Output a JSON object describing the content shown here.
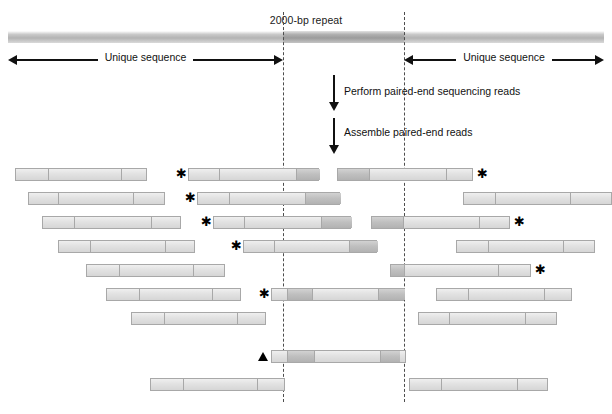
{
  "figure": {
    "width": 612,
    "height": 414,
    "background": "#ffffff"
  },
  "genome": {
    "repeat_label": "2000-bp repeat",
    "left_unique_label": "Unique sequence",
    "right_unique_label": "Unique sequence",
    "repeat_start_x": 283,
    "repeat_end_x": 404,
    "band_color": "#b3b3b3",
    "repeat_color": "#9b9b9b"
  },
  "steps": [
    {
      "label": "Perform paired-end sequencing reads"
    },
    {
      "label": "Assemble paired-end reads"
    }
  ],
  "markers": {
    "star_glyph": "✱",
    "triangle_name": "triangle-marker"
  },
  "chart_data": {
    "type": "diagram",
    "repeat_region": {
      "start_x": 283,
      "end_x": 404,
      "length_bp": 2000
    },
    "reads": [
      {
        "row": 1,
        "x": 15,
        "w": 132,
        "ticks": [
          32,
          105
        ],
        "dark": [],
        "star": null
      },
      {
        "row": 1,
        "x": 188,
        "w": 131,
        "ticks": [
          30,
          107
        ],
        "dark": [
          [
            107,
            24
          ]
        ],
        "star": "left"
      },
      {
        "row": 1,
        "x": 337,
        "w": 136,
        "ticks": [
          31,
          108
        ],
        "dark": [
          [
            0,
            31
          ]
        ],
        "star": "right"
      },
      {
        "row": 2,
        "x": 28,
        "w": 137,
        "ticks": [
          29,
          104
        ],
        "dark": [],
        "star": null
      },
      {
        "row": 2,
        "x": 197,
        "w": 143,
        "ticks": [
          31,
          107
        ],
        "dark": [
          [
            107,
            36
          ]
        ],
        "star": "left"
      },
      {
        "row": 2,
        "x": 463,
        "w": 149,
        "ticks": [
          31,
          106
        ],
        "dark": [],
        "star": null
      },
      {
        "row": 3,
        "x": 42,
        "w": 139,
        "ticks": [
          31,
          108
        ],
        "dark": [],
        "star": null
      },
      {
        "row": 3,
        "x": 213,
        "w": 138,
        "ticks": [
          30,
          107
        ],
        "dark": [
          [
            107,
            31
          ]
        ],
        "star": "left"
      },
      {
        "row": 3,
        "x": 371,
        "w": 139,
        "ticks": [
          31,
          107
        ],
        "dark": [
          [
            0,
            31
          ]
        ],
        "star": "right"
      },
      {
        "row": 4,
        "x": 58,
        "w": 137,
        "ticks": [
          31,
          106
        ],
        "dark": [],
        "star": null
      },
      {
        "row": 4,
        "x": 243,
        "w": 134,
        "ticks": [
          30,
          105
        ],
        "dark": [
          [
            105,
            29
          ]
        ],
        "star": "left"
      },
      {
        "row": 4,
        "x": 456,
        "w": 139,
        "ticks": [
          31,
          106
        ],
        "dark": [],
        "star": null
      },
      {
        "row": 5,
        "x": 86,
        "w": 139,
        "ticks": [
          32,
          106
        ],
        "dark": [],
        "star": null
      },
      {
        "row": 5,
        "x": 390,
        "w": 141,
        "ticks": [
          13,
          107
        ],
        "dark": [
          [
            0,
            13
          ]
        ],
        "star": "right"
      },
      {
        "row": 6,
        "x": 106,
        "w": 135,
        "ticks": [
          32,
          105
        ],
        "dark": [],
        "star": null
      },
      {
        "row": 6,
        "x": 271,
        "w": 133,
        "ticks": [
          15,
          40,
          106
        ],
        "dark": [
          [
            15,
            25
          ],
          [
            106,
            27
          ]
        ],
        "star": "left"
      },
      {
        "row": 6,
        "x": 436,
        "w": 136,
        "ticks": [
          31,
          107
        ],
        "dark": [],
        "star": null
      },
      {
        "row": 7,
        "x": 131,
        "w": 135,
        "ticks": [
          32,
          105
        ],
        "dark": [],
        "star": null
      },
      {
        "row": 7,
        "x": 418,
        "w": 139,
        "ticks": [
          30,
          106
        ],
        "dark": [],
        "star": null
      },
      {
        "row": 8,
        "x": 271,
        "w": 135,
        "ticks": [
          15,
          42,
          108
        ],
        "dark": [
          [
            15,
            27
          ],
          [
            108,
            20
          ]
        ],
        "star": null,
        "triangle": true
      },
      {
        "row": 9,
        "x": 150,
        "w": 135,
        "ticks": [
          32,
          106
        ],
        "dark": [],
        "star": null
      },
      {
        "row": 9,
        "x": 409,
        "w": 139,
        "ticks": [
          31,
          107
        ],
        "dark": [],
        "star": null
      }
    ],
    "row_y": [
      168,
      192,
      216,
      240,
      264,
      288,
      312,
      350,
      378
    ]
  }
}
